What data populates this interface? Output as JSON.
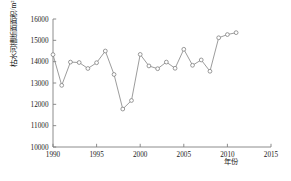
{
  "chart_data": {
    "type": "line",
    "title": "",
    "subtitle": "",
    "xlabel": "年份",
    "ylabel": "枯水河槽断面面积/m²",
    "xlim": [
      1990,
      2015
    ],
    "ylim": [
      10000,
      16000
    ],
    "xticks": [
      1990,
      1995,
      2000,
      2005,
      2010,
      2015
    ],
    "ytick_labels": [
      "10000",
      "11000",
      "12000",
      "13000",
      "14000",
      "15000",
      "16000"
    ],
    "yticks": [
      10000,
      11000,
      12000,
      13000,
      14000,
      15000,
      16000
    ],
    "grid": false,
    "legend": null,
    "marker": "open-circle",
    "line_color": "#808080",
    "marker_color": "#808080",
    "axis_color": "#808080",
    "text_color": "#1a1a1a",
    "series": [
      {
        "name": "枯水河槽断面面积",
        "x": [
          1990,
          1991,
          1992,
          1993,
          1994,
          1995,
          1996,
          1997,
          1998,
          1999,
          2000,
          2001,
          2002,
          2003,
          2004,
          2005,
          2006,
          2007,
          2008,
          2009,
          2010,
          2011
        ],
        "values": [
          14330,
          12890,
          13980,
          13960,
          13680,
          13950,
          14500,
          13400,
          11780,
          12180,
          14340,
          13800,
          13670,
          13980,
          13690,
          14580,
          13830,
          14080,
          13550,
          15120,
          15270,
          15360
        ]
      }
    ]
  },
  "axis": {
    "x_tick_labels": [
      "1990",
      "1995",
      "2000",
      "2005",
      "2010",
      "2015"
    ],
    "y_tick_labels": [
      "16000",
      "15000",
      "14000",
      "13000",
      "12000",
      "11000",
      "10000"
    ]
  }
}
